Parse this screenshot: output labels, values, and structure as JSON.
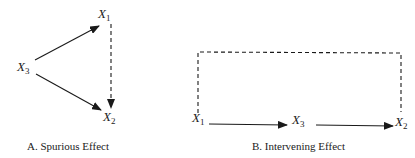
{
  "panels": [
    {
      "id": "A",
      "caption": "A. Spurious Effect",
      "nodes": [
        {
          "label": "X",
          "subscript": "1"
        },
        {
          "label": "X",
          "subscript": "3"
        },
        {
          "label": "X",
          "subscript": "2"
        }
      ],
      "edges": [
        {
          "from": "X3",
          "to": "X1",
          "style": "solid"
        },
        {
          "from": "X3",
          "to": "X2",
          "style": "solid"
        },
        {
          "from": "X1",
          "to": "X2",
          "style": "dashed"
        }
      ]
    },
    {
      "id": "B",
      "caption": "B. Intervening Effect",
      "nodes": [
        {
          "label": "X",
          "subscript": "1"
        },
        {
          "label": "X",
          "subscript": "3"
        },
        {
          "label": "X",
          "subscript": "2"
        }
      ],
      "edges": [
        {
          "from": "X1",
          "to": "X3",
          "style": "solid"
        },
        {
          "from": "X3",
          "to": "X2",
          "style": "solid"
        },
        {
          "from": "X1",
          "to": "X2",
          "style": "dashed"
        }
      ]
    }
  ],
  "colors": {
    "line": "#1a1a1a",
    "text": "#222222",
    "background": "#ffffff"
  }
}
